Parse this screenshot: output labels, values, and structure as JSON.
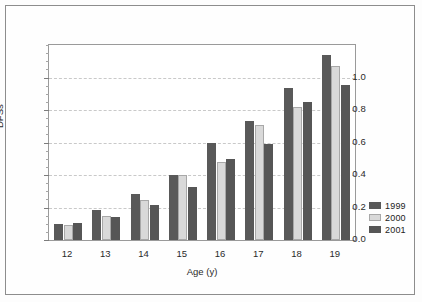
{
  "chart_data": {
    "type": "bar",
    "title": "",
    "xlabel": "Age (y)",
    "ylabel": "DFSs",
    "categories": [
      "12",
      "13",
      "14",
      "15",
      "16",
      "17",
      "18",
      "19"
    ],
    "series": [
      {
        "name": "1999",
        "color": "#595959",
        "values": [
          0.1,
          0.185,
          0.285,
          0.4,
          0.6,
          0.73,
          0.935,
          1.14
        ]
      },
      {
        "name": "2000",
        "color": "#d9d9d9",
        "values": [
          0.09,
          0.15,
          0.245,
          0.4,
          0.48,
          0.71,
          0.82,
          1.07
        ]
      },
      {
        "name": "2001",
        "color": "#565656",
        "values": [
          0.105,
          0.14,
          0.215,
          0.325,
          0.5,
          0.59,
          0.85,
          0.955
        ]
      }
    ],
    "ylim": [
      0.0,
      1.2
    ],
    "ytick_labels": [
      "0.0",
      "0.2",
      "0.4",
      "0.6",
      "0.8",
      "1.0"
    ],
    "ytick_values": [
      0.0,
      0.2,
      0.4,
      0.6,
      0.8,
      1.0
    ],
    "yminor_step": 0.05,
    "grid": true,
    "grid_axis": "y",
    "legend_position": "right",
    "legend_entries": [
      "1999",
      "2000",
      "2001"
    ]
  }
}
